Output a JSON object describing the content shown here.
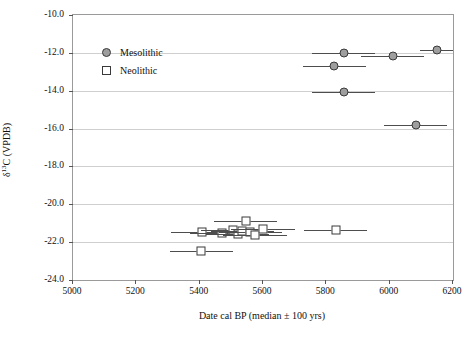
{
  "chart_data": {
    "type": "scatter",
    "title": "",
    "xlabel": "Date cal BP (median ± 100 yrs)",
    "ylabel_html": "δ<sup>13</sup>C (VPDB)",
    "ylabel_plain": "δ13C (VPDB)",
    "xlim": [
      5000,
      6200
    ],
    "ylim": [
      -24.0,
      -10.0
    ],
    "xticks": [
      5000,
      5200,
      5400,
      5600,
      5800,
      6000,
      6200
    ],
    "yticks": [
      -10.0,
      -12.0,
      -14.0,
      -16.0,
      -18.0,
      -20.0,
      -22.0,
      -24.0
    ],
    "ytick_labels": [
      "-10.0",
      "-12.0",
      "-14.0",
      "-16.0",
      "-18.0",
      "-20.0",
      "-22.0",
      "-24.0"
    ],
    "xtick_labels": [
      "5000",
      "5200",
      "5400",
      "5600",
      "5800",
      "6000",
      "6200"
    ],
    "grid": "horizontal",
    "legend_position": "top-left",
    "series": [
      {
        "name": "Mesolithic",
        "marker": "filled-circle",
        "color": "#9e9e9e",
        "edge_color": "#3a3a3a",
        "points": [
          {
            "x": 5855,
            "y": -12.0,
            "xerr": 100
          },
          {
            "x": 5825,
            "y": -12.7,
            "xerr": 100
          },
          {
            "x": 5855,
            "y": -14.05,
            "xerr": 100
          },
          {
            "x": 6010,
            "y": -12.15,
            "xerr": 100
          },
          {
            "x": 6150,
            "y": -11.85,
            "xerr": 55
          },
          {
            "x": 6082,
            "y": -15.8,
            "xerr": 100
          }
        ]
      },
      {
        "name": "Neolithic",
        "marker": "open-square",
        "color": "#ffffff",
        "edge_color": "#3a3a3a",
        "points": [
          {
            "x": 5405,
            "y": -22.45,
            "xerr": 100
          },
          {
            "x": 5408,
            "y": -21.45,
            "xerr": 100
          },
          {
            "x": 5470,
            "y": -21.5,
            "xerr": 100
          },
          {
            "x": 5505,
            "y": -21.35,
            "xerr": 100
          },
          {
            "x": 5520,
            "y": -21.55,
            "xerr": 100
          },
          {
            "x": 5535,
            "y": -21.4,
            "xerr": 100
          },
          {
            "x": 5545,
            "y": -20.9,
            "xerr": 100
          },
          {
            "x": 5560,
            "y": -21.45,
            "xerr": 100
          },
          {
            "x": 5575,
            "y": -21.6,
            "xerr": 100
          },
          {
            "x": 5600,
            "y": -21.3,
            "xerr": 100
          },
          {
            "x": 5830,
            "y": -21.35,
            "xerr": 100
          }
        ]
      }
    ]
  },
  "legend": {
    "items": [
      {
        "label": "Mesolithic",
        "marker": "filled-circle"
      },
      {
        "label": "Neolithic",
        "marker": "open-square"
      }
    ]
  }
}
